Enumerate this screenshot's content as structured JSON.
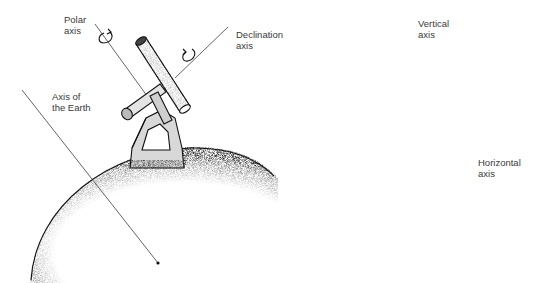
{
  "diagram": {
    "type": "illustration",
    "panels": [
      {
        "id": "equatorial-mount",
        "labels": {
          "polar_axis": "Polar\naxis",
          "declination_axis": "Declination\naxis",
          "earth_axis": "Axis of\nthe Earth"
        }
      },
      {
        "id": "altazimuth-mount",
        "labels": {
          "vertical_axis": "Vertical\naxis",
          "horizontal_axis": "Horizontal\naxis"
        }
      }
    ],
    "colors": {
      "background": "#ffffff",
      "ink": "#1a1a1a",
      "label_text": "#3a3a3a"
    }
  }
}
